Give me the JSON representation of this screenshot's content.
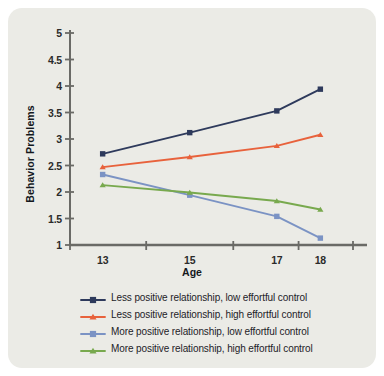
{
  "chart_data": {
    "type": "line",
    "title": "",
    "xlabel": "Age",
    "ylabel": "Behavior Problems",
    "categories": [
      "13",
      "15",
      "17",
      "18"
    ],
    "x": [
      13,
      15,
      17,
      18
    ],
    "xlim": [
      12.25,
      18.75
    ],
    "ylim": [
      1,
      5
    ],
    "yticks": [
      "1",
      "1.5",
      "2",
      "2.5",
      "3",
      "3.5",
      "4",
      "4.5",
      "5"
    ],
    "ytick_values": [
      1,
      1.5,
      2,
      2.5,
      3,
      3.5,
      4,
      4.5,
      5
    ],
    "grid": false,
    "legend_position": "bottom",
    "series": [
      {
        "name": "Less positive relationship, low effortful control",
        "color": "#2e3a5c",
        "marker": "square",
        "values": [
          2.72,
          3.12,
          3.53,
          3.94
        ]
      },
      {
        "name": "Less positive relationship, high effortful control",
        "color": "#e8623c",
        "marker": "triangle",
        "values": [
          2.47,
          2.66,
          2.87,
          3.08
        ]
      },
      {
        "name": "More positive relationship, low effortful control",
        "color": "#7b93c4",
        "marker": "square",
        "values": [
          2.33,
          1.94,
          1.54,
          1.13
        ]
      },
      {
        "name": "More positive relationship, high effortful control",
        "color": "#78a94e",
        "marker": "triangle",
        "values": [
          2.13,
          1.99,
          1.83,
          1.67
        ]
      }
    ]
  },
  "colors": {
    "figure_background": "#ebebe6",
    "page_background": "#ffffff",
    "axis": "#6a6a66",
    "text": "#1d2228"
  }
}
